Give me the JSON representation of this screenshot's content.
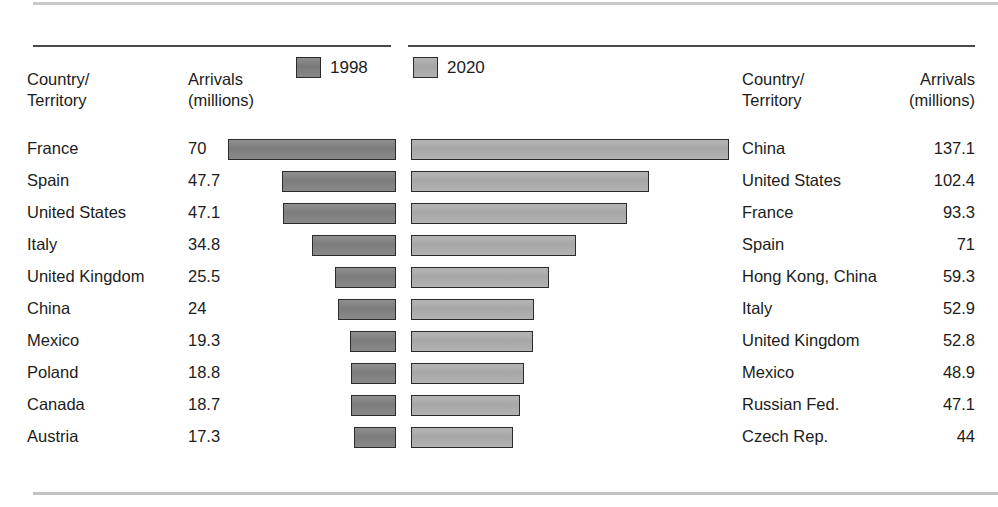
{
  "headers": {
    "left_country": "Country/\nTerritory",
    "left_arrivals": "Arrivals\n(millions)",
    "right_country": "Country/\nTerritory",
    "right_arrivals": "Arrivals\n(millions)"
  },
  "legend": {
    "series_1998": "1998",
    "series_2020": "2020",
    "color_1998": "#7c7c7c",
    "color_2020": "#a7a7a7"
  },
  "chart_data": {
    "type": "bar",
    "title": "",
    "xlabel": "",
    "ylabel": "",
    "orientation": "horizontal",
    "legend_position": "top-center",
    "grid": false,
    "series": [
      {
        "name": "1998",
        "color": "#7c7c7c",
        "direction": "right-to-left",
        "categories": [
          "France",
          "Spain",
          "United States",
          "Italy",
          "United Kingdom",
          "China",
          "Mexico",
          "Poland",
          "Canada",
          "Austria"
        ],
        "values": [
          70,
          47.7,
          47.1,
          34.8,
          25.5,
          24,
          19.3,
          18.8,
          18.7,
          17.3
        ],
        "value_labels": [
          "70",
          "47.7",
          "47.1",
          "34.8",
          "25.5",
          "24",
          "19.3",
          "18.8",
          "18.7",
          "17.3"
        ]
      },
      {
        "name": "2020",
        "color": "#a7a7a7",
        "direction": "left-to-right",
        "categories": [
          "China",
          "United States",
          "France",
          "Spain",
          "Hong Kong, China",
          "Italy",
          "United Kingdom",
          "Mexico",
          "Russian Fed.",
          "Czech Rep."
        ],
        "values": [
          137.1,
          102.4,
          93.3,
          71,
          59.3,
          52.9,
          52.8,
          48.9,
          47.1,
          44
        ],
        "value_labels": [
          "137.1",
          "102.4",
          "93.3",
          "71",
          "59.3",
          "52.9",
          "52.8",
          "48.9",
          "47.1",
          "44"
        ]
      }
    ],
    "xlim_left": [
      0,
      70
    ],
    "xlim_right": [
      0,
      137.1
    ]
  }
}
